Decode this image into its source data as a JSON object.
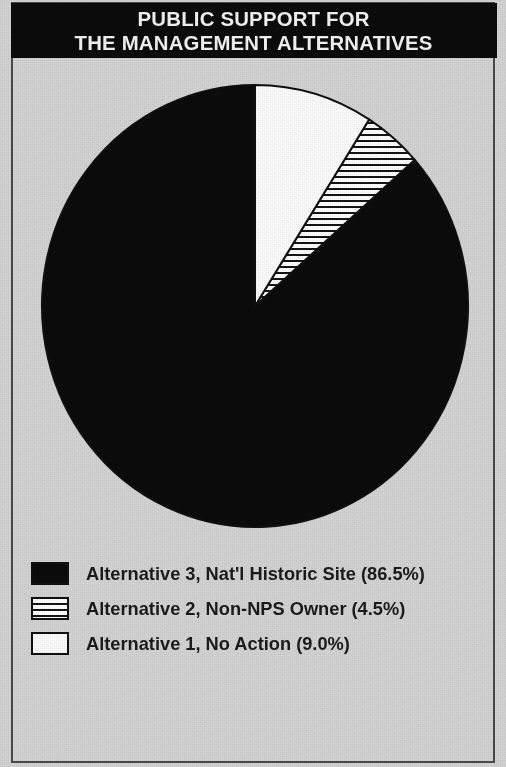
{
  "title": {
    "line1": "PUBLIC SUPPORT FOR",
    "line2": "THE MANAGEMENT ALTERNATIVES"
  },
  "legend": {
    "items": [
      {
        "label": "Alternative 3, Nat'l Historic Site (86.5%)",
        "swatch": "solid-black",
        "swatch_name": "legend-swatch-alternative-3"
      },
      {
        "label": "Alternative 2, Non-NPS Owner (4.5%)",
        "swatch": "striped",
        "swatch_name": "legend-swatch-alternative-2"
      },
      {
        "label": "Alternative 1, No Action (9.0%)",
        "swatch": "solid-white",
        "swatch_name": "legend-swatch-alternative-1"
      }
    ]
  },
  "colors": {
    "banner_background": "#0b0b0b",
    "banner_text": "#f4f4f4",
    "page_background": "#d4d4d4",
    "frame_border": "#4a4a4a",
    "slice_black": "#0b0b0b",
    "slice_white": "#fdfdfd",
    "slice_stripe_line": "#141414",
    "outline": "#101010",
    "legend_text": "#1b1b1b"
  },
  "chart_data": {
    "type": "pie",
    "title": "PUBLIC SUPPORT FOR THE MANAGEMENT ALTERNATIVES",
    "xlabel": "",
    "ylabel": "",
    "legend_position": "bottom-left",
    "grid": false,
    "start_angle_deg": 90,
    "direction": "counterclockwise",
    "units": "percent",
    "categories": [
      "Alternative 3, Nat'l Historic Site",
      "Alternative 2, Non-NPS Owner",
      "Alternative 1, No Action"
    ],
    "values": [
      86.5,
      4.5,
      9.0
    ],
    "labels": [
      "86.5%",
      "4.5%",
      "9.0%"
    ],
    "slices": [
      {
        "name": "Alternative 3, Nat'l Historic Site",
        "value": 86.5,
        "label": "86.5%",
        "fill": "solid-black"
      },
      {
        "name": "Alternative 2, Non-NPS Owner",
        "value": 4.5,
        "label": "4.5%",
        "fill": "horizontal-stripes"
      },
      {
        "name": "Alternative 1, No Action",
        "value": 9.0,
        "label": "9.0%",
        "fill": "solid-white"
      }
    ]
  }
}
